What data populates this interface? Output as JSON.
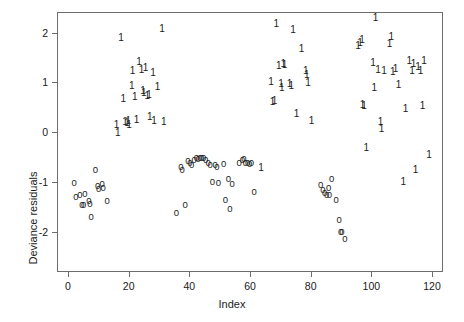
{
  "chart_data": {
    "type": "scatter",
    "title": "",
    "xlabel": "Index",
    "ylabel": "Deviance residuals",
    "xlim": [
      -3,
      123
    ],
    "ylim": [
      -2.35,
      2.45
    ],
    "xticks": [
      0,
      20,
      40,
      60,
      80,
      100,
      120
    ],
    "yticks": [
      -2,
      -1,
      0,
      1,
      2
    ],
    "xtick_labels": [
      "0",
      "20",
      "40",
      "60",
      "80",
      "100",
      "120"
    ],
    "ytick_labels": [
      "-2",
      "-1",
      "0",
      "1",
      "2"
    ],
    "grid": false,
    "legend": null,
    "point_marker": "digit-glyph",
    "marker_note": "Each point is drawn as the text character of its group label: '0' for group 0, '1' for group 1",
    "series": [
      {
        "name": "0",
        "marker_label": "0",
        "color": "#1a1a1a",
        "points": [
          [
            2.0,
            -1.02
          ],
          [
            2.6,
            -1.3
          ],
          [
            3.9,
            -1.26
          ],
          [
            4.6,
            -1.46
          ],
          [
            5.2,
            -1.47
          ],
          [
            5.6,
            -1.24
          ],
          [
            6.9,
            -1.38
          ],
          [
            7.2,
            -1.44
          ],
          [
            7.6,
            -1.7
          ],
          [
            9.0,
            -0.77
          ],
          [
            9.8,
            -1.08
          ],
          [
            10.1,
            -1.14
          ],
          [
            11.3,
            -1.05
          ],
          [
            11.6,
            -1.12
          ],
          [
            12.9,
            -1.39
          ],
          [
            35.7,
            -1.63
          ],
          [
            37.2,
            -0.7
          ],
          [
            37.6,
            -0.76
          ],
          [
            38.6,
            -1.46
          ],
          [
            39.5,
            -0.58
          ],
          [
            40.2,
            -0.62
          ],
          [
            40.8,
            -0.67
          ],
          [
            41.6,
            -0.56
          ],
          [
            42.3,
            -0.53
          ],
          [
            42.9,
            -0.55
          ],
          [
            43.5,
            -0.52
          ],
          [
            44.1,
            -0.52
          ],
          [
            44.7,
            -0.53
          ],
          [
            45.4,
            -0.57
          ],
          [
            46.2,
            -0.63
          ],
          [
            46.9,
            -0.67
          ],
          [
            47.6,
            -1.0
          ],
          [
            48.5,
            -0.67
          ],
          [
            49.1,
            -0.7
          ],
          [
            49.6,
            -1.02
          ],
          [
            51.3,
            -0.64
          ],
          [
            51.9,
            -1.37
          ],
          [
            52.9,
            -0.94
          ],
          [
            53.4,
            -1.54
          ],
          [
            54.1,
            -1.05
          ],
          [
            56.4,
            -0.63
          ],
          [
            57.5,
            -0.57
          ],
          [
            58.0,
            -0.55
          ],
          [
            58.5,
            -0.63
          ],
          [
            59.2,
            -0.62
          ],
          [
            59.9,
            -0.64
          ],
          [
            60.5,
            -0.62
          ],
          [
            61.4,
            -1.2
          ],
          [
            83.3,
            -1.07
          ],
          [
            84.0,
            -1.17
          ],
          [
            84.6,
            -1.22
          ],
          [
            85.3,
            -1.26
          ],
          [
            85.9,
            -1.13
          ],
          [
            86.2,
            -1.27
          ],
          [
            86.9,
            -0.94
          ],
          [
            88.4,
            -1.36
          ],
          [
            89.4,
            -1.76
          ],
          [
            89.9,
            -2.01
          ],
          [
            90.3,
            -2.02
          ],
          [
            91.3,
            -2.15
          ]
        ]
      },
      {
        "name": "1",
        "marker_label": "1",
        "color": "#1a1a1a",
        "points": [
          [
            16.0,
            0.14
          ],
          [
            16.4,
            -0.03
          ],
          [
            17.5,
            1.88
          ],
          [
            18.2,
            0.66
          ],
          [
            18.8,
            0.2
          ],
          [
            19.5,
            0.18
          ],
          [
            19.9,
            0.23
          ],
          [
            20.1,
            0.15
          ],
          [
            21.0,
            0.92
          ],
          [
            21.3,
            1.23
          ],
          [
            22.0,
            0.71
          ],
          [
            22.6,
            0.25
          ],
          [
            23.4,
            1.4
          ],
          [
            24.2,
            1.25
          ],
          [
            24.7,
            0.83
          ],
          [
            25.0,
            0.79
          ],
          [
            25.6,
            1.28
          ],
          [
            26.1,
            0.73
          ],
          [
            26.7,
            0.74
          ],
          [
            27.0,
            0.3
          ],
          [
            28.0,
            1.18
          ],
          [
            28.4,
            0.23
          ],
          [
            29.5,
            0.9
          ],
          [
            31.0,
            2.08
          ],
          [
            31.6,
            0.2
          ],
          [
            63.6,
            -0.73
          ],
          [
            66.9,
            1.0
          ],
          [
            67.4,
            0.6
          ],
          [
            68.1,
            0.62
          ],
          [
            68.7,
            2.18
          ],
          [
            69.5,
            1.33
          ],
          [
            70.2,
            0.96
          ],
          [
            70.5,
            0.89
          ],
          [
            71.0,
            1.36
          ],
          [
            71.4,
            1.35
          ],
          [
            73.0,
            0.97
          ],
          [
            73.6,
            0.92
          ],
          [
            74.2,
            2.05
          ],
          [
            75.3,
            0.37
          ],
          [
            77.0,
            1.67
          ],
          [
            78.4,
            1.22
          ],
          [
            78.7,
            1.14
          ],
          [
            79.1,
            0.98
          ],
          [
            80.3,
            0.22
          ],
          [
            95.6,
            1.73
          ],
          [
            96.3,
            1.79
          ],
          [
            96.9,
            1.85
          ],
          [
            97.1,
            0.54
          ],
          [
            97.6,
            0.53
          ],
          [
            98.3,
            -0.32
          ],
          [
            100.6,
            1.39
          ],
          [
            101.0,
            0.88
          ],
          [
            101.4,
            2.3
          ],
          [
            102.2,
            1.25
          ],
          [
            103.0,
            0.2
          ],
          [
            103.4,
            0.06
          ],
          [
            104.2,
            1.23
          ],
          [
            106.0,
            1.76
          ],
          [
            106.6,
            1.9
          ],
          [
            107.1,
            1.2
          ],
          [
            108.0,
            1.27
          ],
          [
            109.0,
            0.94
          ],
          [
            110.5,
            -1.0
          ],
          [
            111.3,
            0.46
          ],
          [
            112.5,
            1.43
          ],
          [
            113.4,
            1.23
          ],
          [
            113.9,
            1.36
          ],
          [
            114.6,
            -0.76
          ],
          [
            115.4,
            1.3
          ],
          [
            116.2,
            1.22
          ],
          [
            116.9,
            0.52
          ],
          [
            117.4,
            1.42
          ],
          [
            119.0,
            -0.46
          ]
        ]
      }
    ]
  },
  "axis": {
    "y_title": "Deviance residuals",
    "x_title": "Index"
  }
}
